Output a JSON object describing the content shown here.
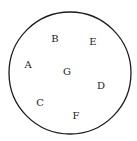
{
  "diagram": {
    "type": "labeled-points-in-circle",
    "circle": {
      "cx": 70,
      "cy": 73,
      "r": 61,
      "stroke": "#1a1a1a"
    },
    "points": [
      {
        "label": "A",
        "x": 28,
        "y": 64
      },
      {
        "label": "B",
        "x": 55,
        "y": 38
      },
      {
        "label": "C",
        "x": 40,
        "y": 102
      },
      {
        "label": "D",
        "x": 101,
        "y": 85
      },
      {
        "label": "E",
        "x": 93,
        "y": 41
      },
      {
        "label": "F",
        "x": 76,
        "y": 115
      },
      {
        "label": "G",
        "x": 67,
        "y": 71
      }
    ]
  }
}
